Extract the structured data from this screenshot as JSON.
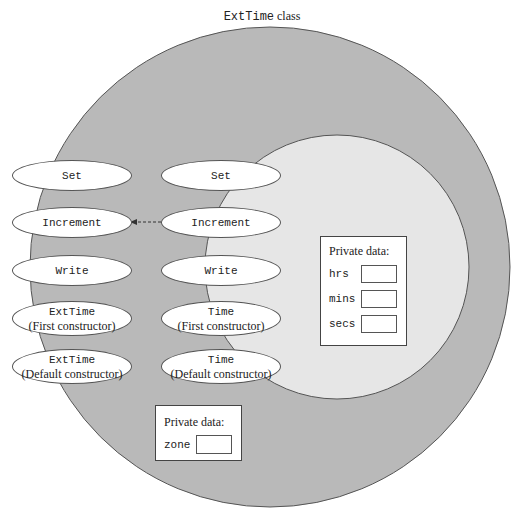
{
  "title": {
    "class_name": "ExtTime",
    "suffix": " class"
  },
  "colors": {
    "outer_circle": "#b9b9b9",
    "inner_circle": "#e6e6e6",
    "outline": "#555555",
    "ellipse_fill": "#ffffff"
  },
  "ext_time_methods": [
    {
      "name": "Set",
      "note": ""
    },
    {
      "name": "Increment",
      "note": ""
    },
    {
      "name": "Write",
      "note": ""
    },
    {
      "name": "ExtTime",
      "note": "(First constructor)"
    },
    {
      "name": "ExtTime",
      "note": "(Default constructor)"
    }
  ],
  "time_methods": [
    {
      "name": "Set",
      "note": ""
    },
    {
      "name": "Increment",
      "note": ""
    },
    {
      "name": "Write",
      "note": ""
    },
    {
      "name": "Time",
      "note": "(First constructor)"
    },
    {
      "name": "Time",
      "note": "(Default constructor)"
    }
  ],
  "time_private": {
    "label": "Private data:",
    "fields": [
      {
        "name": "hrs",
        "value": ""
      },
      {
        "name": "mins",
        "value": ""
      },
      {
        "name": "secs",
        "value": ""
      }
    ]
  },
  "ext_private": {
    "label": "Private data:",
    "fields": [
      {
        "name": "zone",
        "value": ""
      }
    ]
  },
  "arrow": {
    "from": "Time.Increment",
    "to": "ExtTime.Increment",
    "style": "dashed"
  }
}
